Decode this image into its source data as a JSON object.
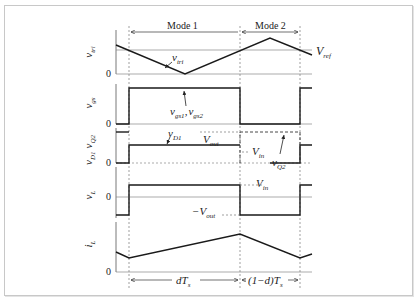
{
  "diagram": {
    "modes": {
      "mode1": "Mode 1",
      "mode2": "Mode 2"
    },
    "signals": [
      {
        "id": "vtri",
        "axis_label": "v",
        "axis_sub": "tri",
        "zero": "0"
      },
      {
        "id": "vgs",
        "axis_label": "v",
        "axis_sub": "gs",
        "zero": "0"
      },
      {
        "id": "vD1Q2",
        "axis_label": "v",
        "axis_sub": "D1",
        "axis_label2": "v",
        "axis_sub2": "Q2",
        "zero": "0"
      },
      {
        "id": "vL",
        "axis_label": "v",
        "axis_sub": "L",
        "zero": "0"
      },
      {
        "id": "iL",
        "axis_label": "i",
        "axis_sub": "L",
        "zero": "0"
      }
    ],
    "annotations": {
      "vtri_curve": {
        "main": "v",
        "sub": "tri"
      },
      "vref": {
        "main": "V",
        "sub": "ref"
      },
      "vgs_curve": {
        "main1": "v",
        "sub1": "gs1",
        "sep": ",",
        "main2": "v",
        "sub2": "gs2"
      },
      "vD1_curve": {
        "main": "v",
        "sub": "D1"
      },
      "vout_level": {
        "main": "V",
        "sub": "out"
      },
      "vin_level_q2": {
        "main": "V",
        "sub": "in"
      },
      "vQ2_curve": {
        "main": "v",
        "sub": "Q2"
      },
      "vin_level_L": {
        "main": "V",
        "sub": "in"
      },
      "neg_vout_level": {
        "prefix": "−",
        "main": "V",
        "sub": "out"
      }
    },
    "intervals": {
      "on": "dT",
      "on_sub": "s",
      "off_prefix": "(1−d)T",
      "off_sub": "s"
    },
    "colors": {
      "trace": "#1a1a1a",
      "axis": "#555555",
      "dashed": "#777777",
      "frame": "#c8c8c8"
    }
  }
}
